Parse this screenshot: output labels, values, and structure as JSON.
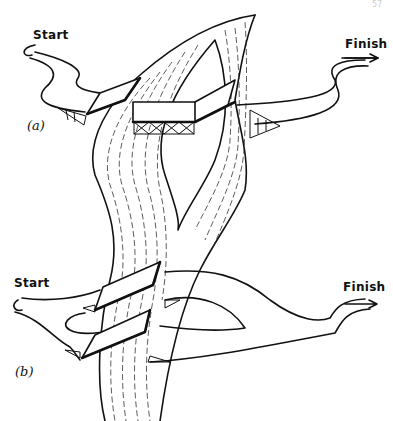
{
  "figure": {
    "page_number": "57",
    "panel_a": {
      "label": "(a)",
      "start_label": "Start",
      "finish_label": "Finish"
    },
    "panel_b": {
      "label": "(b)",
      "start_label": "Start",
      "finish_label": "Finish"
    }
  },
  "colors": {
    "ink": "#111111",
    "background": "#ffffff"
  }
}
